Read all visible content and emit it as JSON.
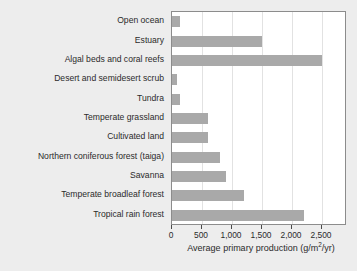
{
  "chart_data": {
    "type": "bar",
    "orientation": "horizontal",
    "title": "",
    "xlabel": "Average primary production (g/m2/yr)",
    "xlabel_parts": {
      "before": "Average primary production (g/m",
      "sup": "2",
      "after": "/yr)"
    },
    "ylabel": "",
    "categories": [
      "Open ocean",
      "Estuary",
      "Algal beds and coral reefs",
      "Desert and semidesert scrub",
      "Tundra",
      "Temperate grassland",
      "Cultivated land",
      "Northern coniferous forest (taiga)",
      "Savanna",
      "Temperate broadleaf forest",
      "Tropical rain forest"
    ],
    "values": [
      125,
      1500,
      2500,
      90,
      140,
      600,
      600,
      800,
      900,
      1200,
      2200
    ],
    "xlim": [
      0,
      2900
    ],
    "xticks": [
      0,
      500,
      1000,
      1500,
      2000,
      2500
    ],
    "xticklabels": [
      "0",
      "500",
      "1,000",
      "1,500",
      "2,000",
      "2,500"
    ],
    "grid": "vertical",
    "legend": "none",
    "bar_color": "#a9a9a9",
    "plot_background": "#ffffff",
    "figure_background": "#ededed",
    "axis_color": "#8c8c8c"
  }
}
